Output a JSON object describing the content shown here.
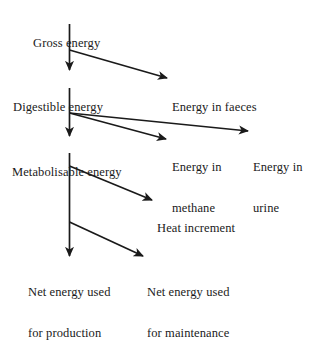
{
  "diagram": {
    "type": "flowchart",
    "background_color": "#ffffff",
    "line_color": "#1a1a1a",
    "nodes": [
      {
        "id": "gross",
        "label": "Gross energy",
        "lines": [
          "Gross energy"
        ]
      },
      {
        "id": "digestible",
        "label": "Digestible energy",
        "lines": [
          "Digestible energy"
        ]
      },
      {
        "id": "faeces",
        "label": "Energy in faeces",
        "lines": [
          "Energy in faeces"
        ]
      },
      {
        "id": "metabolisable",
        "label": "Metabolisable energy",
        "lines": [
          "Metabolisable energy"
        ]
      },
      {
        "id": "methane",
        "label": "Energy in methane",
        "lines": [
          "Energy in",
          "methane"
        ]
      },
      {
        "id": "urine",
        "label": "Energy in urine",
        "lines": [
          "Energy in",
          "urine"
        ]
      },
      {
        "id": "heat",
        "label": "Heat increment",
        "lines": [
          "Heat increment"
        ]
      },
      {
        "id": "production",
        "label": "Net energy used for production",
        "lines": [
          "Net energy used",
          "for production"
        ]
      },
      {
        "id": "maintenance",
        "label": "Net energy used for maintenance",
        "lines": [
          "Net energy used",
          "for maintenance"
        ]
      }
    ],
    "edges": [
      {
        "id": "gross-to-digestible",
        "from": "gross",
        "to": "digestible",
        "kind": "vertical"
      },
      {
        "id": "gross-to-faeces",
        "from": "gross",
        "to": "faeces",
        "kind": "diagonal"
      },
      {
        "id": "digestible-to-metabolisable",
        "from": "digestible",
        "to": "metabolisable",
        "kind": "vertical"
      },
      {
        "id": "digestible-to-methane",
        "from": "digestible",
        "to": "methane",
        "kind": "diagonal"
      },
      {
        "id": "digestible-to-urine",
        "from": "digestible",
        "to": "urine",
        "kind": "diagonal"
      },
      {
        "id": "metabolisable-to-production",
        "from": "metabolisable",
        "to": "production",
        "kind": "vertical"
      },
      {
        "id": "metabolisable-to-heat",
        "from": "metabolisable",
        "to": "heat",
        "kind": "diagonal"
      },
      {
        "id": "metabolisable-to-maintenance",
        "from": "metabolisable",
        "to": "maintenance",
        "kind": "diagonal"
      }
    ]
  }
}
